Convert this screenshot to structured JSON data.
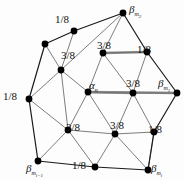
{
  "figure": {
    "name": "subdivision-stencil",
    "type": "triangular-mesh-stencil",
    "background": "#fdfdfd",
    "edge_color": "#1a1a1a",
    "inner_edge_color": "#6e6e6e",
    "highlight_edge_color": "#8a8a8a",
    "vertex_color": "#000000"
  },
  "vertices": [
    {
      "id": "v-top",
      "x": 123,
      "y": 13,
      "r": 3.4
    },
    {
      "id": "v-upper-left-outer",
      "x": 45,
      "y": 44,
      "r": 3.4
    },
    {
      "id": "v-upper-mid",
      "x": 74,
      "y": 31,
      "r": 3.4
    },
    {
      "id": "v-ul-inner",
      "x": 61,
      "y": 70,
      "r": 3.4
    },
    {
      "id": "v-top-inner",
      "x": 103,
      "y": 53,
      "r": 3.4
    },
    {
      "id": "v-tr",
      "x": 147,
      "y": 52,
      "r": 3.4
    },
    {
      "id": "v-left",
      "x": 29,
      "y": 99,
      "r": 3.4
    },
    {
      "id": "v-center",
      "x": 88,
      "y": 92,
      "r": 3.4
    },
    {
      "id": "v-right-mid",
      "x": 133,
      "y": 93,
      "r": 3.4
    },
    {
      "id": "v-right",
      "x": 177,
      "y": 93,
      "r": 3.4
    },
    {
      "id": "v-ll-inner",
      "x": 68,
      "y": 130,
      "r": 3.4
    },
    {
      "id": "v-lower-mid",
      "x": 115,
      "y": 134,
      "r": 3.4
    },
    {
      "id": "v-lr",
      "x": 154,
      "y": 132,
      "r": 3.4
    },
    {
      "id": "v-bottom-left",
      "x": 38,
      "y": 161,
      "r": 3.4
    },
    {
      "id": "v-bottom-mid",
      "x": 95,
      "y": 167,
      "r": 3.4
    },
    {
      "id": "v-bottom-right",
      "x": 148,
      "y": 170,
      "r": 3.4
    }
  ],
  "edges_outer": [
    [
      "v-top",
      "v-upper-mid"
    ],
    [
      "v-upper-mid",
      "v-upper-left-outer"
    ],
    [
      "v-upper-left-outer",
      "v-left"
    ],
    [
      "v-left",
      "v-bottom-left"
    ],
    [
      "v-bottom-left",
      "v-bottom-mid"
    ],
    [
      "v-bottom-mid",
      "v-bottom-right"
    ],
    [
      "v-bottom-right",
      "v-lr"
    ],
    [
      "v-lr",
      "v-right"
    ],
    [
      "v-right",
      "v-tr"
    ],
    [
      "v-tr",
      "v-top"
    ]
  ],
  "edges_inner": [
    [
      "v-top",
      "v-top-inner"
    ],
    [
      "v-top",
      "v-ul-inner"
    ],
    [
      "v-upper-mid",
      "v-ul-inner"
    ],
    [
      "v-upper-left-outer",
      "v-ul-inner"
    ],
    [
      "v-ul-inner",
      "v-left"
    ],
    [
      "v-ul-inner",
      "v-center"
    ],
    [
      "v-ul-inner",
      "v-ll-inner"
    ],
    [
      "v-top-inner",
      "v-tr"
    ],
    [
      "v-top-inner",
      "v-center"
    ],
    [
      "v-top-inner",
      "v-right-mid"
    ],
    [
      "v-tr",
      "v-right-mid"
    ],
    [
      "v-center",
      "v-right-mid"
    ],
    [
      "v-center",
      "v-ll-inner"
    ],
    [
      "v-center",
      "v-lower-mid"
    ],
    [
      "v-right-mid",
      "v-right"
    ],
    [
      "v-right-mid",
      "v-lower-mid"
    ],
    [
      "v-right-mid",
      "v-lr"
    ],
    [
      "v-left",
      "v-ll-inner"
    ],
    [
      "v-ll-inner",
      "v-bottom-left"
    ],
    [
      "v-ll-inner",
      "v-lower-mid"
    ],
    [
      "v-ll-inner",
      "v-bottom-mid"
    ],
    [
      "v-lower-mid",
      "v-bottom-mid"
    ],
    [
      "v-lower-mid",
      "v-bottom-right"
    ],
    [
      "v-lower-mid",
      "v-lr"
    ],
    [
      "v-lr",
      "v-bottom-right"
    ]
  ],
  "edges_highlight": [
    [
      "v-top-inner",
      "v-tr"
    ],
    [
      "v-center",
      "v-right-mid"
    ],
    [
      "v-center",
      "v-right"
    ]
  ],
  "labels": {
    "weights": [
      {
        "id": "w-top-left",
        "text": "1/8",
        "x": 55,
        "y": 14
      },
      {
        "id": "w-upper-inner",
        "text": "3/8",
        "x": 61,
        "y": 50
      },
      {
        "id": "w-top-inner",
        "text": "3/8",
        "x": 97,
        "y": 40
      },
      {
        "id": "w-top-right",
        "text": "1/8",
        "x": 137,
        "y": 44
      },
      {
        "id": "w-left",
        "text": "1/8",
        "x": 3,
        "y": 91
      },
      {
        "id": "w-right-mid",
        "text": "3/8",
        "x": 126,
        "y": 78
      },
      {
        "id": "w-lower-left",
        "text": "3/8",
        "x": 66,
        "y": 122
      },
      {
        "id": "w-lower-mid",
        "text": "3/8",
        "x": 110,
        "y": 120
      },
      {
        "id": "w-lower-right",
        "text": "1/8",
        "x": 148,
        "y": 124
      },
      {
        "id": "w-bottom",
        "text": "1/8",
        "x": 72,
        "y": 160
      }
    ],
    "greek": [
      {
        "id": "lbl-alpha-n",
        "base": "α",
        "sub": "n",
        "subsub": "",
        "x": 89,
        "y": 80
      },
      {
        "id": "lbl-beta-m2",
        "base": "β",
        "sub": "m",
        "subsub": "2",
        "x": 129,
        "y": 4
      },
      {
        "id": "lbl-beta-m1",
        "base": "β",
        "sub": "m",
        "subsub": "1",
        "x": 158,
        "y": 78
      },
      {
        "id": "lbl-beta-mi",
        "base": "β",
        "sub": "m",
        "subsub": "i",
        "x": 151,
        "y": 163
      },
      {
        "id": "lbl-beta-mi-1",
        "base": "β",
        "sub": "m",
        "subsub": "i−1",
        "x": 26,
        "y": 163
      }
    ]
  }
}
